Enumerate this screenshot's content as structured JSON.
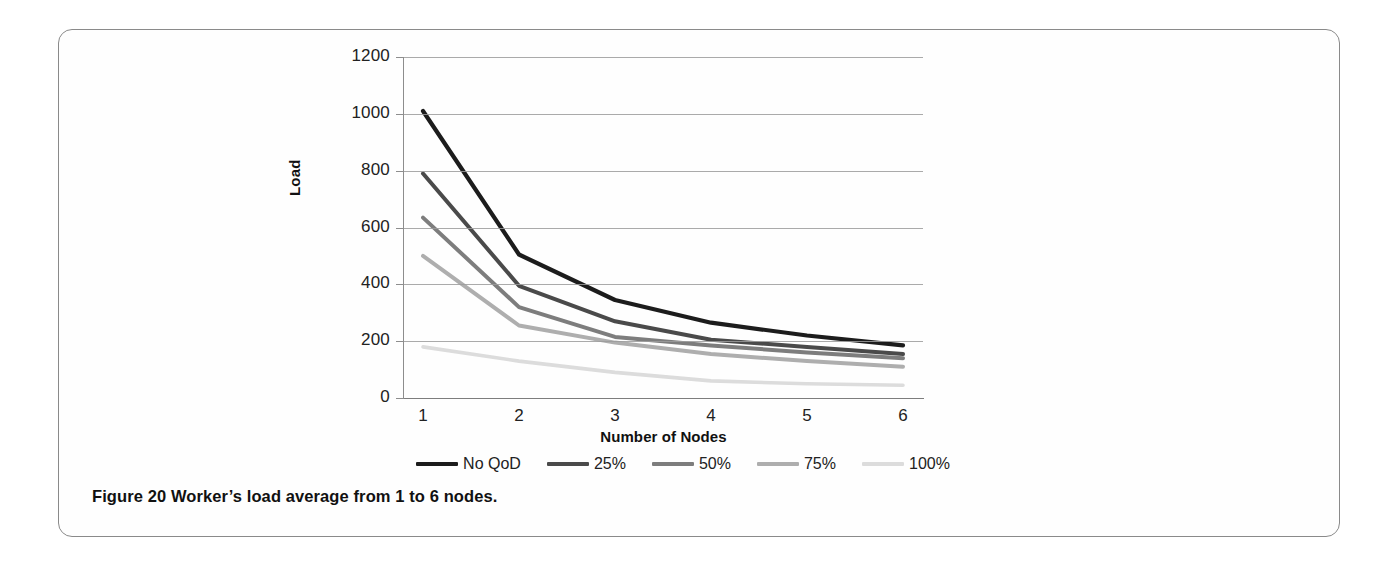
{
  "caption": {
    "prefix": "Figure 20",
    "text": " Worker’s load average from 1 to 6 nodes."
  },
  "chart_data": {
    "type": "line",
    "title": "",
    "xlabel": "Number of Nodes",
    "ylabel": "Load",
    "categories": [
      1,
      2,
      3,
      4,
      5,
      6
    ],
    "xtick_labels": [
      "1",
      "2",
      "3",
      "4",
      "5",
      "6"
    ],
    "ytick_labels": [
      "0",
      "200",
      "400",
      "600",
      "800",
      "1000",
      "1200"
    ],
    "yticks": [
      0,
      200,
      400,
      600,
      800,
      1000,
      1200
    ],
    "ylim": [
      0,
      1200
    ],
    "grid": "horizontal",
    "legend_position": "bottom",
    "series": [
      {
        "name": "No QoD",
        "color": "#1c1c1c",
        "width": 4.2,
        "values": [
          1010,
          505,
          345,
          265,
          220,
          185
        ]
      },
      {
        "name": "25%",
        "color": "#4a4a4a",
        "width": 4.0,
        "values": [
          790,
          395,
          270,
          205,
          180,
          155
        ]
      },
      {
        "name": "50%",
        "color": "#7d7d7d",
        "width": 4.0,
        "values": [
          635,
          320,
          215,
          185,
          160,
          140
        ]
      },
      {
        "name": "75%",
        "color": "#aeaeae",
        "width": 4.0,
        "values": [
          500,
          255,
          195,
          155,
          130,
          110
        ]
      },
      {
        "name": "100%",
        "color": "#dcdcdc",
        "width": 3.6,
        "values": [
          180,
          130,
          90,
          60,
          50,
          45
        ]
      }
    ]
  }
}
